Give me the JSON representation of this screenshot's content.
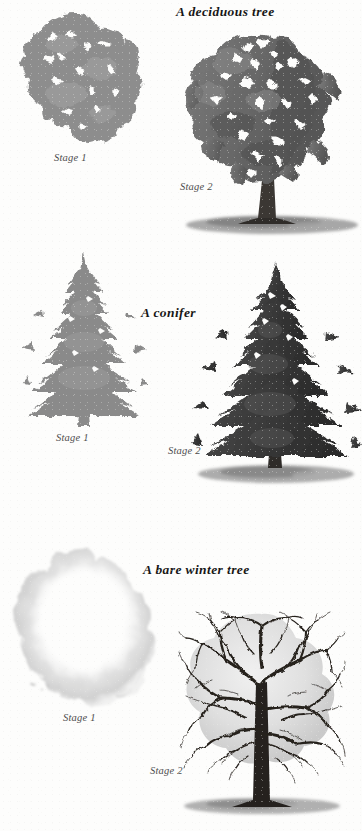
{
  "page": {
    "kind": "scanned-illustration-page",
    "background_color": "#fdfdfc",
    "sections": [
      {
        "id": "deciduous",
        "heading": "A deciduous tree",
        "stages": [
          {
            "label": "Stage 1",
            "subject": "deciduous-tree-flat-wash",
            "fill_color": "#8d8d8d",
            "has_trunk": false,
            "has_shadow": false
          },
          {
            "label": "Stage 2",
            "subject": "deciduous-tree-modelled",
            "fill_color": "#6d6d6d",
            "has_trunk": true,
            "has_shadow": true
          }
        ]
      },
      {
        "id": "conifer",
        "heading": "A conifer",
        "stages": [
          {
            "label": "Stage 1",
            "subject": "conifer-flat-wash",
            "fill_color": "#898989",
            "has_trunk": false,
            "has_shadow": false
          },
          {
            "label": "Stage 2",
            "subject": "conifer-modelled",
            "fill_color": "#3b3b3b",
            "has_trunk": true,
            "has_shadow": true
          }
        ]
      },
      {
        "id": "bare",
        "heading": "A bare winter tree",
        "stages": [
          {
            "label": "Stage 1",
            "subject": "bare-tree-pale-outline-wash",
            "fill_color": "#dedede",
            "has_trunk": false,
            "has_shadow": false
          },
          {
            "label": "Stage 2",
            "subject": "bare-tree-branch-detail",
            "fill_color": "#2a2a2a",
            "has_trunk": true,
            "has_shadow": true
          }
        ]
      }
    ]
  }
}
